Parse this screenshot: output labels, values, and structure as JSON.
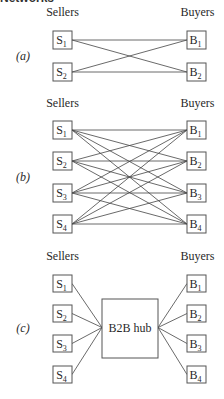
{
  "heading": "Networks",
  "panels": [
    {
      "label": "(a)",
      "sellers_header": "Sellers",
      "buyers_header": "Buyers",
      "sellers": [
        {
          "name": "S",
          "sub": "1"
        },
        {
          "name": "S",
          "sub": "2"
        }
      ],
      "buyers": [
        {
          "name": "B",
          "sub": "1"
        },
        {
          "name": "B",
          "sub": "2"
        }
      ],
      "topology": "full-mesh"
    },
    {
      "label": "(b)",
      "sellers_header": "Sellers",
      "buyers_header": "Buyers",
      "sellers": [
        {
          "name": "S",
          "sub": "1"
        },
        {
          "name": "S",
          "sub": "2"
        },
        {
          "name": "S",
          "sub": "3"
        },
        {
          "name": "S",
          "sub": "4"
        }
      ],
      "buyers": [
        {
          "name": "B",
          "sub": "1"
        },
        {
          "name": "B",
          "sub": "2"
        },
        {
          "name": "B",
          "sub": "3"
        },
        {
          "name": "B",
          "sub": "4"
        }
      ],
      "topology": "full-mesh"
    },
    {
      "label": "(c)",
      "sellers_header": "Sellers",
      "buyers_header": "Buyers",
      "hub": "B2B hub",
      "sellers": [
        {
          "name": "S",
          "sub": "1"
        },
        {
          "name": "S",
          "sub": "2"
        },
        {
          "name": "S",
          "sub": "3"
        },
        {
          "name": "S",
          "sub": "4"
        }
      ],
      "buyers": [
        {
          "name": "B",
          "sub": "1"
        },
        {
          "name": "B",
          "sub": "2"
        },
        {
          "name": "B",
          "sub": "3"
        },
        {
          "name": "B",
          "sub": "4"
        }
      ],
      "topology": "hub"
    }
  ]
}
